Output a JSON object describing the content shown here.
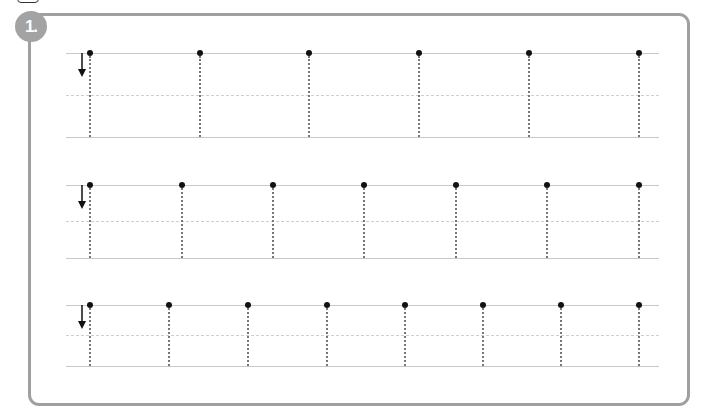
{
  "worksheet": {
    "badge_label": "1.",
    "instruction_icon": "down-arrow-icon",
    "rows": [
      {
        "top": 53,
        "mid": 95,
        "bottom": 137,
        "dots_x": [
          90,
          200,
          309,
          419,
          529,
          639
        ]
      },
      {
        "top": 185,
        "mid": 221,
        "bottom": 258,
        "dots_x": [
          90,
          182,
          273,
          364,
          456,
          547,
          639
        ]
      },
      {
        "top": 305,
        "mid": 335,
        "bottom": 366,
        "dots_x": [
          90,
          169,
          248,
          327,
          405,
          483,
          561,
          639
        ]
      }
    ],
    "colors": {
      "frame": "#a0a0a0",
      "badge": "#a3a3a3",
      "guide_line": "#c8c8c8",
      "trace_line": "#777777",
      "dot": "#111111"
    }
  }
}
